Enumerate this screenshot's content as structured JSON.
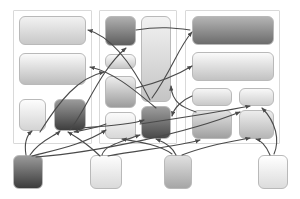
{
  "diagram": {
    "canvas": {
      "width": 300,
      "height": 199,
      "background": "#ffffff"
    },
    "style": {
      "group_border_color": "#d9d9d9",
      "node_border_color": "#b9b9b9",
      "edge_color": "#4a4a4a",
      "edge_width": 1.1,
      "node_corner_radius": 6
    },
    "groups": [
      {
        "id": "group-1",
        "name": "group-left",
        "x": 13,
        "y": 10,
        "width": 79,
        "height": 134,
        "nodes": [
          {
            "id": "g1-n1",
            "name": "node-g1-1",
            "x": 19,
            "y": 16,
            "width": 67,
            "height": 29,
            "shade_from": "#f2f2f2",
            "shade_to": "#c8c8c8"
          },
          {
            "id": "g1-n2",
            "name": "node-g1-2",
            "x": 19,
            "y": 53,
            "width": 67,
            "height": 32,
            "shade_from": "#fafafa",
            "shade_to": "#bcbcbc"
          },
          {
            "id": "g1-n3",
            "name": "node-g1-3",
            "x": 19,
            "y": 99,
            "width": 27,
            "height": 32,
            "shade_from": "#fdfdfd",
            "shade_to": "#d4d4d4"
          },
          {
            "id": "g1-n4",
            "name": "node-g1-4",
            "x": 54,
            "y": 99,
            "width": 32,
            "height": 32,
            "shade_from": "#9a9a9a",
            "shade_to": "#3e3e3e"
          }
        ]
      },
      {
        "id": "group-2",
        "name": "group-middle",
        "x": 99,
        "y": 10,
        "width": 78,
        "height": 134,
        "nodes": [
          {
            "id": "g2-n1",
            "name": "node-g2-1",
            "x": 105,
            "y": 16,
            "width": 31,
            "height": 30,
            "shade_from": "#b0b0b0",
            "shade_to": "#5e5e5e"
          },
          {
            "id": "g2-n2",
            "name": "node-g2-2",
            "x": 105,
            "y": 54,
            "width": 31,
            "height": 15,
            "shade_from": "#fafafa",
            "shade_to": "#c6c6c6"
          },
          {
            "id": "g2-n3",
            "name": "node-g2-3",
            "x": 105,
            "y": 76,
            "width": 31,
            "height": 32,
            "shade_from": "#ededed",
            "shade_to": "#9c9c9c"
          },
          {
            "id": "g2-n4",
            "name": "node-g2-4",
            "x": 105,
            "y": 112,
            "width": 31,
            "height": 27,
            "shade_from": "#fbfbfb",
            "shade_to": "#d8d8d8"
          },
          {
            "id": "g2-n5",
            "name": "node-g2-5",
            "x": 141,
            "y": 16,
            "width": 30,
            "height": 86,
            "shade_from": "#f2f2f2",
            "shade_to": "#c4c4c4"
          },
          {
            "id": "g2-n6",
            "name": "node-g2-6",
            "x": 141,
            "y": 106,
            "width": 30,
            "height": 33,
            "shade_from": "#9d9d9d",
            "shade_to": "#4a4a4a"
          }
        ]
      },
      {
        "id": "group-3",
        "name": "group-right",
        "x": 185,
        "y": 10,
        "width": 95,
        "height": 134,
        "nodes": [
          {
            "id": "g3-n1",
            "name": "node-g3-1",
            "x": 192,
            "y": 16,
            "width": 82,
            "height": 29,
            "shade_from": "#b4b4b4",
            "shade_to": "#6c6c6c"
          },
          {
            "id": "g3-n2",
            "name": "node-g3-2",
            "x": 192,
            "y": 52,
            "width": 82,
            "height": 29,
            "shade_from": "#fafafa",
            "shade_to": "#c2c2c2"
          },
          {
            "id": "g3-n3",
            "name": "node-g3-3",
            "x": 192,
            "y": 88,
            "width": 40,
            "height": 18,
            "shade_from": "#f6f6f6",
            "shade_to": "#c9c9c9"
          },
          {
            "id": "g3-n4",
            "name": "node-g3-4",
            "x": 239,
            "y": 88,
            "width": 35,
            "height": 18,
            "shade_from": "#f8f8f8",
            "shade_to": "#cfcfcf"
          },
          {
            "id": "g3-n5",
            "name": "node-g3-5",
            "x": 192,
            "y": 110,
            "width": 40,
            "height": 29,
            "shade_from": "#e2e2e2",
            "shade_to": "#a0a0a0"
          },
          {
            "id": "g3-n6",
            "name": "node-g3-6",
            "x": 239,
            "y": 110,
            "width": 35,
            "height": 29,
            "shade_from": "#ededed",
            "shade_to": "#b6b6b6"
          }
        ]
      }
    ],
    "bottom_nodes": [
      {
        "id": "b1",
        "name": "bottom-node-1",
        "x": 13,
        "y": 155,
        "width": 30,
        "height": 34,
        "shade_from": "#9a9a9a",
        "shade_to": "#3c3c3c"
      },
      {
        "id": "b2",
        "name": "bottom-node-2",
        "x": 90,
        "y": 155,
        "width": 32,
        "height": 34,
        "shade_from": "#fdfdfd",
        "shade_to": "#dadada"
      },
      {
        "id": "b3",
        "name": "bottom-node-3",
        "x": 164,
        "y": 155,
        "width": 28,
        "height": 34,
        "shade_from": "#e0e0e0",
        "shade_to": "#a6a6a6"
      },
      {
        "id": "b4",
        "name": "bottom-node-4",
        "x": 258,
        "y": 155,
        "width": 30,
        "height": 34,
        "shade_from": "#ffffff",
        "shade_to": "#dcdcdc"
      }
    ],
    "edges": [
      {
        "id": "e1",
        "name": "edge-b1-to-g1n4",
        "path": "M 30 155 C 40 140 55 136 60 131",
        "arrow": true
      },
      {
        "id": "e2",
        "name": "edge-b1-to-g1n3",
        "path": "M 26 155 C 24 143 26 136 32 131",
        "arrow": true
      },
      {
        "id": "e3",
        "name": "edge-b1-to-g2n4",
        "path": "M 32 156 C 55 150 85 144 106 130",
        "arrow": true
      },
      {
        "id": "e4",
        "name": "edge-b2-to-g2n6",
        "path": "M 102 155 C 104 148 110 145 140 135",
        "arrow": true
      },
      {
        "id": "e5",
        "name": "edge-b2-to-g1n4",
        "path": "M 100 156 C 90 146 78 138 68 132",
        "arrow": true
      },
      {
        "id": "e6",
        "name": "edge-b2-to-g3n5",
        "path": "M 108 156 C 140 150 180 146 200 140",
        "arrow": true
      },
      {
        "id": "e7",
        "name": "edge-b3-to-g2n6",
        "path": "M 176 155 C 172 146 164 142 156 139",
        "arrow": true
      },
      {
        "id": "e8",
        "name": "edge-b3-to-g2n4",
        "path": "M 172 154 C 160 145 140 142 122 139",
        "arrow": true
      },
      {
        "id": "e9",
        "name": "edge-b4-to-g3n6",
        "path": "M 270 155 C 266 145 260 140 256 139",
        "arrow": true
      },
      {
        "id": "e10",
        "name": "edge-b4-to-g3n4",
        "path": "M 274 154 C 280 140 276 122 262 108",
        "arrow": true
      },
      {
        "id": "e11",
        "name": "edge-g1n4-to-g2n1",
        "path": "M 70 130 C 86 110 100 70 126 48",
        "arrow": true
      },
      {
        "id": "e12",
        "name": "edge-g1n2-to-g2n3",
        "path": "M 40 132 C 60 100 78 78 104 72",
        "arrow": true
      },
      {
        "id": "e13",
        "name": "edge-g2n5-to-g1n1",
        "path": "M 150 100 C 130 60 110 36 88 30",
        "arrow": true
      },
      {
        "id": "e14",
        "name": "edge-g2n6-to-g1n2",
        "path": "M 156 108 C 130 86 112 72 90 67",
        "arrow": true
      },
      {
        "id": "e15",
        "name": "edge-g2n5-to-g3n1",
        "path": "M 152 98 C 172 70 178 48 192 32",
        "arrow": true
      },
      {
        "id": "e16",
        "name": "edge-g2n3-to-g3n2",
        "path": "M 136 88 C 160 82 176 76 192 66",
        "arrow": true
      },
      {
        "id": "e17",
        "name": "edge-g3n5-to-g2n5",
        "path": "M 196 112 C 185 108 172 104 171 86",
        "arrow": true
      },
      {
        "id": "e18",
        "name": "edge-g3n3-to-g2n6",
        "path": "M 192 96 C 182 100 174 108 172 116",
        "arrow": true
      },
      {
        "id": "e19",
        "name": "edge-b1-long-to-g3",
        "path": "M 36 157 C 100 152 190 132 240 112",
        "arrow": true
      },
      {
        "id": "e20",
        "name": "edge-g2n4-to-g1n4",
        "path": "M 106 124 C 96 128 84 130 74 132",
        "arrow": true
      },
      {
        "id": "e21",
        "name": "edge-g1n4-to-g2n6",
        "path": "M 80 128 C 110 126 134 124 144 120",
        "arrow": true
      },
      {
        "id": "e22",
        "name": "edge-cross-g2-g3",
        "path": "M 140 124 C 180 118 220 112 250 106",
        "arrow": true
      },
      {
        "id": "e23",
        "name": "edge-b3-to-g3n6",
        "path": "M 182 155 C 210 144 240 140 250 138",
        "arrow": true
      },
      {
        "id": "e24",
        "name": "edge-g2n1-to-g3n1",
        "path": "M 136 30 C 160 26 175 28 190 30",
        "arrow": false
      }
    ]
  }
}
